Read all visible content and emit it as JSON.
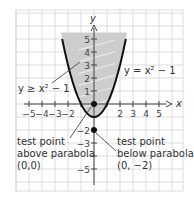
{
  "chart_data": {
    "type": "line",
    "title": "",
    "xlabel": "x",
    "ylabel": "y",
    "xlim": [
      -6,
      7
    ],
    "ylim": [
      -6,
      7
    ],
    "grid": true,
    "x_ticks": [
      -5,
      -4,
      -3,
      -2,
      2,
      3,
      4,
      5
    ],
    "x_tick_labels": [
      "−5",
      "−4",
      "−3",
      "−2",
      "2",
      "3",
      "4",
      "5"
    ],
    "y_ticks": [
      5,
      4,
      3,
      2,
      1,
      -2,
      -3,
      -5
    ],
    "y_tick_labels": [
      "5",
      "4",
      "3",
      "2",
      "1",
      "−2",
      "−3",
      "−5"
    ],
    "series": [
      {
        "name": "y = x² − 1",
        "type": "curve",
        "function": "x^2 - 1",
        "x_range": [
          -2.45,
          2.45
        ],
        "color": "#111111"
      }
    ],
    "shaded_region": {
      "inequality": "y ≥ x² − 1",
      "color": "#c8c8c8",
      "y_max": 5.5
    },
    "points": [
      {
        "x": 0,
        "y": 0,
        "label": "test point above parabola (0,0)"
      },
      {
        "x": 0,
        "y": -2,
        "label": "test point below parabola (0, −2)"
      }
    ],
    "annotations": {
      "curve_label": "y = x² − 1",
      "inequality_label": "y ≥ x² − 1",
      "point_above": [
        "test point",
        "above parabola",
        "(0,0)"
      ],
      "point_below": [
        "test point",
        "below parabola",
        "(0, −2)"
      ]
    }
  },
  "colors": {
    "grid": "#cfcfcf",
    "axis": "#444444",
    "curve": "#111111",
    "shade": "#c8c8c8"
  }
}
